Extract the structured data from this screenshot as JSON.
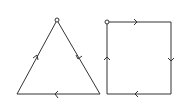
{
  "diagram": {
    "type": "directed-closed-paths",
    "figures": [
      {
        "name": "triangle",
        "start_vertex": "apex",
        "vertices": [
          [
            57,
            20
          ],
          [
            100,
            94
          ],
          [
            17,
            94
          ]
        ],
        "direction": "clockwise",
        "edges": [
          "apex->bottom-right (down-right)",
          "bottom-right->bottom-left (left)",
          "bottom-left->apex (up-right)"
        ]
      },
      {
        "name": "square",
        "start_vertex": "top-left",
        "vertices": [
          [
            107,
            22
          ],
          [
            171,
            22
          ],
          [
            171,
            94
          ],
          [
            107,
            94
          ]
        ],
        "direction": "clockwise",
        "edges": [
          "top-left->top-right (right)",
          "top-right->bottom-right (down)",
          "bottom-right->bottom-left (left)",
          "bottom-left->top-left (up)"
        ]
      }
    ],
    "colors": {
      "line": "#333333",
      "background": "#ffffff"
    }
  }
}
